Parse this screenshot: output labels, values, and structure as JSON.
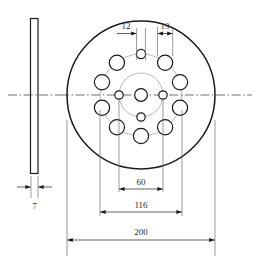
{
  "drawing": {
    "title": "Mechanical flange / disc plate engineering drawing",
    "units": "mm",
    "colors": {
      "outline": "#1a1a1a",
      "thin_line": "#6e6e6e",
      "dimension": "#3a3a3a",
      "centerline": "#4a4a4a",
      "background": "#ffffff",
      "text": "#2b2b2b"
    },
    "views": {
      "side": {
        "name": "side-section-view",
        "thickness_label": "7"
      },
      "front": {
        "name": "front-face-view"
      }
    },
    "dimensions": [
      {
        "id": "hole-dia-small",
        "label": "12",
        "arrows": "right",
        "position": "top-left-inner"
      },
      {
        "id": "hole-dia-large",
        "label": "19",
        "arrows": "both",
        "position": "top-right-inner"
      },
      {
        "id": "inner-bolt-circle",
        "label": "60",
        "arrows": "both",
        "position": "below-disc"
      },
      {
        "id": "outer-bolt-circle",
        "label": "116",
        "arrows": "both",
        "position": "below-disc"
      },
      {
        "id": "outer-diameter",
        "label": "200",
        "arrows": "both",
        "position": "bottom"
      },
      {
        "id": "plate-thickness",
        "label": "7",
        "arrows": "inward",
        "position": "below-side-view"
      }
    ],
    "geometry": {
      "outer_diameter": 200,
      "outer_bolt_circle": 116,
      "inner_bolt_circle": 60,
      "large_hole_diameter": 19,
      "small_hole_diameter": 12,
      "plate_thickness": 7,
      "outer_hole_count": 10,
      "inner_hole_count": 4,
      "center_hole": 1
    }
  }
}
